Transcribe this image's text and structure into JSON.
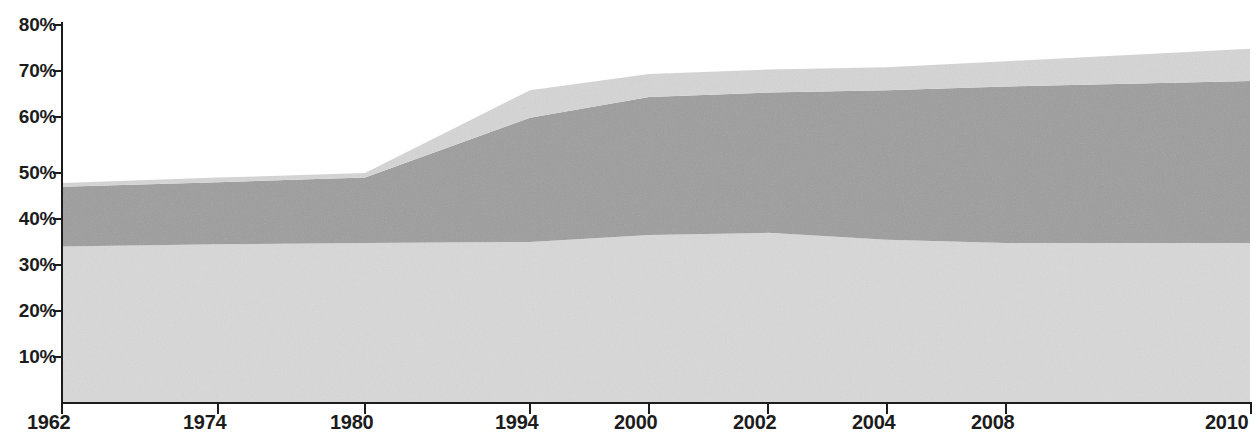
{
  "chart_data": {
    "type": "area",
    "title": "",
    "subtitle": "",
    "xlabel": "",
    "ylabel": "",
    "stacked": true,
    "grid": false,
    "legend_position": "none",
    "xlim": [
      0,
      9
    ],
    "ylim": [
      0,
      80
    ],
    "x_tick_labels": [
      "1962",
      "1974",
      "1980",
      "1994",
      "2000",
      "2002",
      "2004",
      "2008",
      "2010"
    ],
    "x_tick_positions_px": [
      62,
      218,
      365,
      530,
      649,
      768,
      887,
      1006,
      1250
    ],
    "y_tick_labels": [
      "10%",
      "20%",
      "30%",
      "40%",
      "50%",
      "60%",
      "70%",
      "80%"
    ],
    "y_tick_values": [
      10,
      20,
      30,
      40,
      50,
      60,
      70,
      80
    ],
    "x": [
      "1962",
      "1974",
      "1980",
      "1994",
      "2000",
      "2002",
      "2004",
      "2008",
      "2010"
    ],
    "series": [
      {
        "name": "bottom-band",
        "color": "#d8d8d8",
        "values": [
          34.0,
          34.5,
          34.8,
          35.0,
          36.5,
          37.0,
          35.5,
          34.8,
          34.8
        ]
      },
      {
        "name": "middle-band",
        "color": "#9d9d9d",
        "values": [
          13.0,
          13.5,
          14.2,
          27.0,
          30.0,
          30.5,
          32.5,
          34.0,
          35.2
        ]
      },
      {
        "name": "top-band",
        "color": "#d5d5d5",
        "values": [
          0.8,
          1.0,
          1.0,
          6.0,
          5.0,
          5.0,
          5.0,
          5.5,
          7.0
        ]
      }
    ],
    "cumulative_top_totals": [
      47.8,
      49.0,
      50.0,
      68.0,
      71.5,
      72.5,
      73.0,
      74.3,
      77.0
    ],
    "colors": {
      "bottom_band": "#d8d8d8",
      "middle_band": "#9d9d9d",
      "top_band": "#d5d5d5",
      "axis": "#1c1c1c",
      "background": "#ffffff"
    }
  },
  "axis": {
    "y_ticks": [
      {
        "label": "80%",
        "value": 80
      },
      {
        "label": "70%",
        "value": 70
      },
      {
        "label": "60%",
        "value": 60
      },
      {
        "label": "50%",
        "value": 50
      },
      {
        "label": "40%",
        "value": 40
      },
      {
        "label": "30%",
        "value": 30
      },
      {
        "label": "20%",
        "value": 20
      },
      {
        "label": "10%",
        "value": 10
      }
    ],
    "x_ticks": [
      {
        "label": "1962"
      },
      {
        "label": "1974"
      },
      {
        "label": "1980"
      },
      {
        "label": "1994"
      },
      {
        "label": "2000"
      },
      {
        "label": "2002"
      },
      {
        "label": "2004"
      },
      {
        "label": "2008"
      },
      {
        "label": "2010"
      }
    ]
  }
}
